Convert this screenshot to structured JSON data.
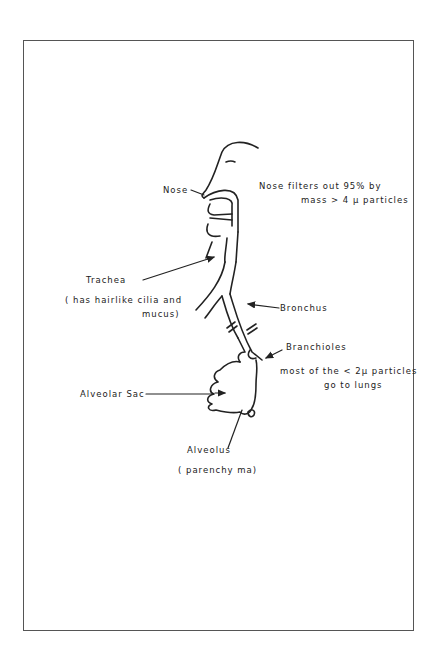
{
  "diagram": {
    "title": "",
    "stroke_color": "#222222",
    "labels": {
      "nose": "Nose",
      "nose_note_line1": "Nose filters out 95% by",
      "nose_note_line2": "mass > 4 µ particles",
      "trachea": "Trachea",
      "trachea_note_line1": "( has hairlike cilia and",
      "trachea_note_line2": "mucus)",
      "bronchus": "Bronchus",
      "bronchioles": "Branchioles",
      "bronchioles_note_line1": "most of the < 2µ particles",
      "bronchioles_note_line2": "go to lungs",
      "alveolar_sac": "Alveolar Sac",
      "alveolus": "Alveolus",
      "alveolus_note": "( parenchy ma)"
    }
  }
}
